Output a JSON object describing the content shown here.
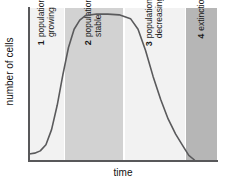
{
  "chart_data": {
    "type": "line",
    "title": "",
    "xlabel": "time",
    "ylabel": "number of cells",
    "grid": false,
    "legend": "none",
    "annotations": [
      {
        "number": "1",
        "text": "population\ngrowing",
        "phase": "lag and exponential growth",
        "x_start": 0,
        "x_end": 0.19,
        "band_color": "#f2f2f2"
      },
      {
        "number": "2",
        "text": "population\nstable",
        "phase": "stationary plateau",
        "x_start": 0.19,
        "x_end": 0.5,
        "band_color": "#d2d2d2"
      },
      {
        "number": "3",
        "text": "population\ndecreasing",
        "phase": "death / decline",
        "x_start": 0.5,
        "x_end": 0.835,
        "band_color": "#f2f2f2"
      },
      {
        "number": "4",
        "text": "extinction",
        "phase": "extinction",
        "x_start": 0.835,
        "x_end": 1.0,
        "band_color": "#b6b6b6"
      }
    ],
    "series": [
      {
        "name": "number of cells",
        "curve_color": "#5a5a5c",
        "x": [
          0.0,
          0.03,
          0.06,
          0.09,
          0.12,
          0.15,
          0.18,
          0.21,
          0.24,
          0.27,
          0.3,
          0.36,
          0.42,
          0.48,
          0.54,
          0.58,
          0.62,
          0.66,
          0.7,
          0.74,
          0.78,
          0.82,
          0.85,
          0.88
        ],
        "y": [
          0.04,
          0.045,
          0.06,
          0.1,
          0.2,
          0.36,
          0.56,
          0.74,
          0.86,
          0.92,
          0.95,
          0.96,
          0.96,
          0.955,
          0.93,
          0.86,
          0.72,
          0.55,
          0.4,
          0.27,
          0.17,
          0.09,
          0.03,
          0.0
        ]
      }
    ],
    "xlim": [
      0,
      1
    ],
    "ylim": [
      0,
      1
    ]
  },
  "axes": {
    "y_title": "number of cells",
    "x_title": "time"
  },
  "bands": [
    {
      "number": "1",
      "label": "population\ngrowing"
    },
    {
      "number": "2",
      "label": "population\nstable"
    },
    {
      "number": "3",
      "label": "population\ndecreasing"
    },
    {
      "number": "4",
      "label": "extinction"
    }
  ],
  "colors": {
    "band_light": "#f2f2f2",
    "band_medium": "#d2d2d2",
    "band_dark": "#b6b6b6",
    "curve": "#5a5a5c",
    "axis": "#58585a",
    "text": "#111111"
  }
}
